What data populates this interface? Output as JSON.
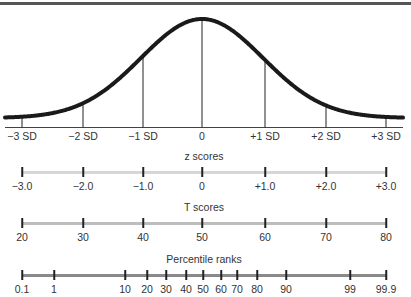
{
  "curve": {
    "sd_labels": [
      "−3 SD",
      "−2 SD",
      "−1 SD",
      "0",
      "+1 SD",
      "+2 SD",
      "+3 SD"
    ],
    "sd_positions": [
      22,
      83,
      143,
      202,
      265,
      326,
      386
    ]
  },
  "scales": [
    {
      "title": "z scores",
      "bar_color": "#d6d6d6",
      "labels": [
        "−3.0",
        "−2.0",
        "−1.0",
        "0",
        "+1.0",
        "+2.0",
        "+3.0"
      ],
      "positions": [
        22,
        83,
        143,
        202,
        265,
        326,
        386
      ]
    },
    {
      "title": "T scores",
      "bar_color": "#bdbdbd",
      "labels": [
        "20",
        "30",
        "40",
        "50",
        "60",
        "70",
        "80"
      ],
      "positions": [
        22,
        83,
        143,
        202,
        265,
        326,
        386
      ]
    },
    {
      "title": "Percentile ranks",
      "bar_color": "#8a8a8a",
      "labels": [
        "0.1",
        "1",
        "10",
        "20",
        "30",
        "40",
        "50",
        "60",
        "70",
        "80",
        "90",
        "99",
        "99.9"
      ],
      "positions": [
        22,
        54,
        125,
        147,
        166,
        186,
        203,
        221,
        237,
        257,
        286,
        350,
        386
      ]
    }
  ],
  "chart_data": {
    "type": "line",
    "x": [
      -3,
      -2,
      -1,
      0,
      1,
      2,
      3
    ],
    "x_tick_labels": [
      "−3 SD",
      "−2 SD",
      "−1 SD",
      "0",
      "+1 SD",
      "+2 SD",
      "+3 SD"
    ],
    "series": [
      {
        "name": "Normal curve",
        "values": [
          0.004,
          0.054,
          0.242,
          0.399,
          0.242,
          0.054,
          0.004
        ]
      }
    ],
    "scales": {
      "z scores": [
        "-3.0",
        "-2.0",
        "-1.0",
        "0",
        "+1.0",
        "+2.0",
        "+3.0"
      ],
      "T scores": [
        20,
        30,
        40,
        50,
        60,
        70,
        80
      ],
      "Percentile ranks": [
        0.1,
        1,
        10,
        20,
        30,
        40,
        50,
        60,
        70,
        80,
        90,
        99,
        99.9
      ]
    },
    "grid": false
  }
}
